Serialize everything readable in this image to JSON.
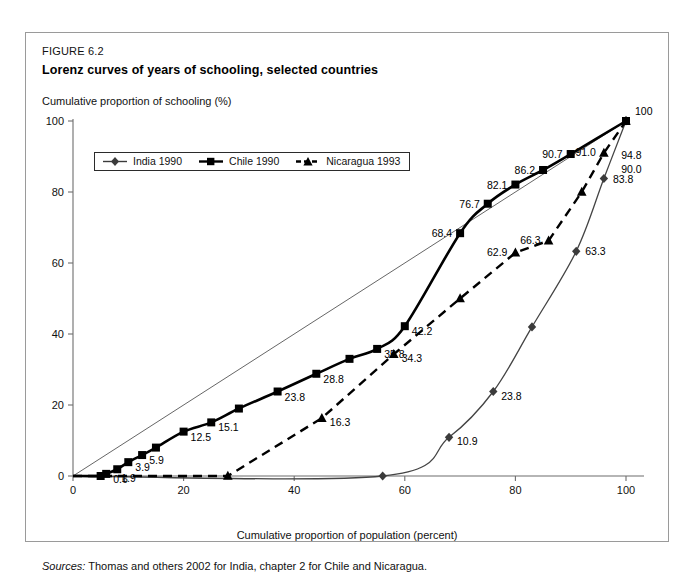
{
  "figure": {
    "number": "FIGURE 6.2",
    "title": "Lorenz curves of years of schooling, selected countries",
    "y_axis_title": "Cumulative proportion of schooling (%)",
    "x_axis_title": "Cumulative proportion of population (percent)",
    "sources_label": "Sources:",
    "sources_text": "Thomas and others 2002 for India, chapter 2 for Chile and Nicaragua."
  },
  "legend": {
    "position": "top-left-inside",
    "entries": [
      {
        "label": "India 1990",
        "marker": "diamond",
        "color": "#3b3b3b",
        "line": "solid-thin"
      },
      {
        "label": "Chile 1990",
        "marker": "square",
        "color": "#000000",
        "line": "solid-thick"
      },
      {
        "label": "Nicaragua 1993",
        "marker": "triangle",
        "color": "#000000",
        "line": "dashed"
      }
    ]
  },
  "chart_data": {
    "type": "line",
    "title": "Lorenz curves of years of schooling, selected countries",
    "xlabel": "Cumulative proportion of population (percent)",
    "ylabel": "Cumulative proportion of schooling (%)",
    "xlim": [
      0,
      100
    ],
    "ylim": [
      0,
      100
    ],
    "xticks": [
      0,
      20,
      40,
      60,
      80,
      100
    ],
    "yticks": [
      0,
      20,
      40,
      60,
      80,
      100
    ],
    "grid": false,
    "reference_line": {
      "name": "line of equality",
      "x": [
        0,
        100
      ],
      "y": [
        0,
        100
      ]
    },
    "series": [
      {
        "name": "India 1990",
        "marker": "diamond",
        "style": "solid-thin",
        "color": "#3b3b3b",
        "x": [
          0,
          56,
          68,
          76,
          83,
          91,
          96,
          100
        ],
        "values": [
          0,
          0,
          10.9,
          23.8,
          42.0,
          63.3,
          83.8,
          100
        ],
        "point_labels": [
          "",
          "",
          "10.9",
          "23.8",
          "",
          "63.3",
          "83.8",
          ""
        ],
        "extra_labels": [
          {
            "text": "94.8",
            "x": 97.5,
            "y": 90.5
          }
        ]
      },
      {
        "name": "Chile 1990",
        "marker": "square",
        "style": "solid-thick",
        "color": "#000000",
        "x": [
          0,
          5,
          6,
          8,
          10,
          12.5,
          15,
          20,
          25,
          30,
          37,
          44,
          50,
          55,
          60,
          70,
          75,
          80,
          85,
          90,
          100
        ],
        "values": [
          0,
          0,
          0.6,
          1.9,
          3.9,
          5.9,
          8.0,
          12.5,
          15.1,
          19.0,
          23.8,
          28.8,
          33.0,
          35.8,
          42.2,
          68.4,
          76.7,
          82.1,
          86.2,
          90.7,
          100
        ],
        "point_labels": [
          "",
          "",
          "0.6",
          "1.9",
          "3.9",
          "5.9",
          "",
          "12.5",
          "15.1",
          "",
          "23.8",
          "28.8",
          "",
          "35.8",
          "42.2",
          "68.4",
          "76.7",
          "82.1",
          "86.2",
          "90.7",
          "100"
        ]
      },
      {
        "name": "Nicaragua 1993",
        "marker": "triangle",
        "style": "dashed",
        "color": "#000000",
        "x": [
          0,
          28,
          45,
          58,
          70,
          80,
          86,
          92,
          96,
          100
        ],
        "values": [
          0,
          0,
          16.3,
          34.3,
          50.0,
          62.9,
          66.3,
          80.0,
          91.0,
          100
        ],
        "point_labels": [
          "",
          "",
          "16.3",
          "34.3",
          "",
          "62.9",
          "66.3",
          "",
          "91.0",
          ""
        ],
        "extra_labels": [
          {
            "text": "90.0",
            "x": 97.5,
            "y": 86.5
          }
        ]
      }
    ]
  }
}
